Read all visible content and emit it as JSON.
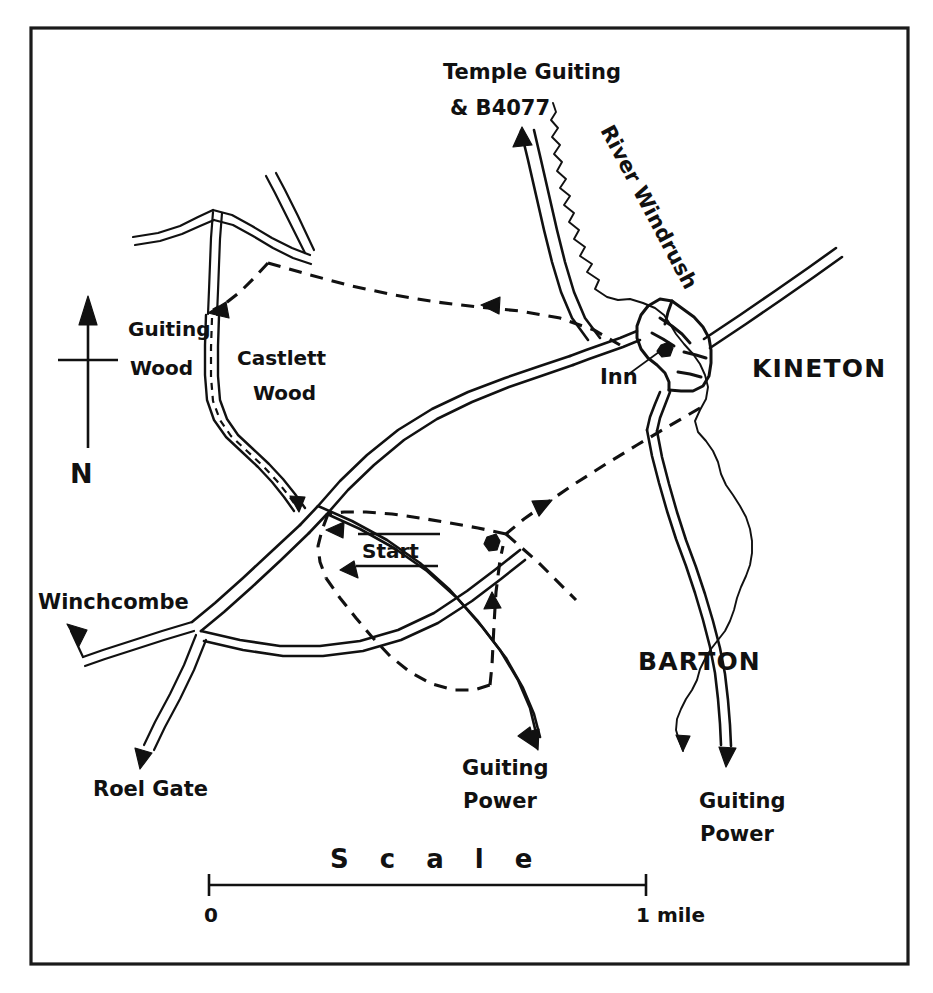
{
  "map": {
    "title": "Kineton area walking route map",
    "frame": {
      "x": 31,
      "y": 28,
      "width": 877,
      "height": 936
    },
    "ink_color": "#111111",
    "background_color": "#ffffff"
  },
  "north_arrow": {
    "label": "N"
  },
  "place_labels": [
    {
      "id": "temple-guiting",
      "text": "Temple Guiting",
      "x": 443,
      "y": 79,
      "class": "lbl-place"
    },
    {
      "id": "b4077",
      "text": "& B4077",
      "x": 450,
      "y": 115,
      "class": "lbl-place"
    },
    {
      "id": "river-windrush",
      "text": "River Windrush",
      "x": 600,
      "y": 130,
      "class": "lbl-place",
      "rotate": 62
    },
    {
      "id": "kineton",
      "text": "KINETON",
      "x": 752,
      "y": 377,
      "class": "lbl-place-caps"
    },
    {
      "id": "inn",
      "text": "Inn",
      "x": 600,
      "y": 384,
      "class": "lbl-place"
    },
    {
      "id": "guiting-wood",
      "text": "Guiting",
      "x": 128,
      "y": 336,
      "class": "lbl-wood"
    },
    {
      "id": "guiting-wood-2",
      "text": "Wood",
      "x": 130,
      "y": 375,
      "class": "lbl-wood"
    },
    {
      "id": "castlett-wood",
      "text": "Castlett",
      "x": 237,
      "y": 365,
      "class": "lbl-wood"
    },
    {
      "id": "castlett-wood-2",
      "text": "Wood",
      "x": 253,
      "y": 400,
      "class": "lbl-wood"
    },
    {
      "id": "winchcombe",
      "text": "Winchcombe",
      "x": 38,
      "y": 609,
      "class": "lbl-place"
    },
    {
      "id": "roel-gate",
      "text": "Roel Gate",
      "x": 93,
      "y": 796,
      "class": "lbl-place"
    },
    {
      "id": "guiting-power-sw",
      "text": "Guiting",
      "x": 462,
      "y": 775,
      "class": "lbl-place"
    },
    {
      "id": "guiting-power-sw2",
      "text": "Power",
      "x": 463,
      "y": 808,
      "class": "lbl-place"
    },
    {
      "id": "barton",
      "text": "BARTON",
      "x": 638,
      "y": 670,
      "class": "lbl-place-caps"
    },
    {
      "id": "guiting-power-se",
      "text": "Guiting",
      "x": 699,
      "y": 808,
      "class": "lbl-place"
    },
    {
      "id": "guiting-power-se2",
      "text": "Power",
      "x": 700,
      "y": 841,
      "class": "lbl-place"
    }
  ],
  "start_marker": {
    "label": "Start",
    "x": 362,
    "y": 556
  },
  "scale_bar": {
    "word": "S c a l e",
    "left_label": "0",
    "right_label": "1 mile",
    "x_left": 208,
    "x_right": 647,
    "y": 885
  }
}
